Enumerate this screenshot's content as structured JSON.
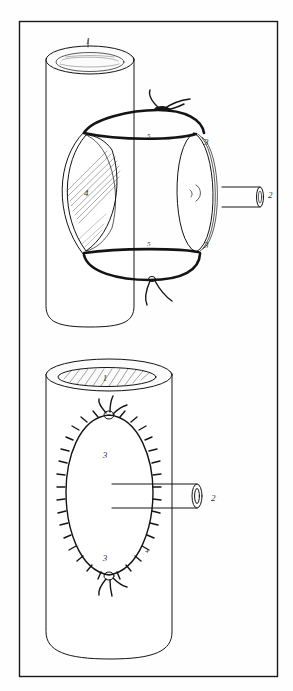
{
  "figure": {
    "border_color": "#1a1a1a",
    "ink_color": "#141414",
    "background_color": "#fefefe",
    "panels": [
      {
        "id": "upper-panel",
        "name": "upper-diagram",
        "description": "Tubular organ with lateral ellipse opening, side tube anastomosis held by two circumferential ligature sutures with knots and free tails",
        "labels": [
          {
            "id": "u1",
            "text": "1",
            "meaning": "proximal lumen opening",
            "x": 88,
            "y": 44
          },
          {
            "id": "u2",
            "text": "2",
            "meaning": "side branch tube / graft",
            "x": 268,
            "y": 198
          },
          {
            "id": "u3a",
            "text": "3",
            "meaning": "anastomosis edge",
            "x": 204,
            "y": 145
          },
          {
            "id": "u3b",
            "text": "3",
            "meaning": "anastomosis edge",
            "x": 204,
            "y": 248
          },
          {
            "id": "u4",
            "text": "4",
            "meaning": "hatched lenticular defect",
            "x": 84,
            "y": 196
          },
          {
            "id": "u5a",
            "text": "5",
            "meaning": "ligature suture",
            "x": 147,
            "y": 138
          },
          {
            "id": "u5b",
            "text": "5",
            "meaning": "ligature suture",
            "x": 147,
            "y": 246
          }
        ]
      },
      {
        "id": "lower-panel",
        "name": "lower-diagram",
        "description": "Tubular organ viewed frontally with completed interrupted suture line in an oval around an inserted tube",
        "labels": [
          {
            "id": "l1",
            "text": "1",
            "meaning": "proximal lumen opening (hatched)",
            "x": 105,
            "y": 377
          },
          {
            "id": "l2",
            "text": "2",
            "meaning": "inserted tube / graft",
            "x": 213,
            "y": 508
          },
          {
            "id": "l3a",
            "text": "3",
            "meaning": "sutured margin",
            "x": 105,
            "y": 455
          },
          {
            "id": "l3b",
            "text": "3",
            "meaning": "sutured margin",
            "x": 105,
            "y": 558
          },
          {
            "id": "l4",
            "text": "4",
            "meaning": "interrupted stitch",
            "x": 145,
            "y": 553
          }
        ]
      }
    ]
  }
}
